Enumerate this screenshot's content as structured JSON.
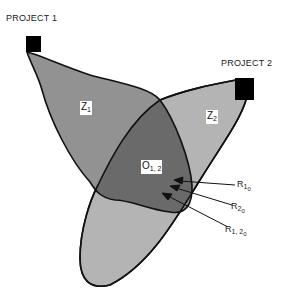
{
  "diagram": {
    "projects": [
      {
        "label": "PROJECT 1",
        "zone_label": "Z",
        "zone_sub": "1"
      },
      {
        "label": "PROJECT 2",
        "zone_label": "Z",
        "zone_sub": "2"
      }
    ],
    "overlap": {
      "label": "O",
      "sub": "1, 2"
    },
    "pointers": [
      {
        "label": "R",
        "sub": "1",
        "subsub": "0"
      },
      {
        "label": "R",
        "sub": "2",
        "subsub": "0"
      },
      {
        "label": "R",
        "sub": "1, 2",
        "subsub": "0"
      }
    ],
    "colors": {
      "zone1": "#8c8c8c",
      "zone2": "#b4b4b4",
      "overlap": "#6a6a6a",
      "outline": "#111111",
      "marker": "#000000"
    }
  }
}
